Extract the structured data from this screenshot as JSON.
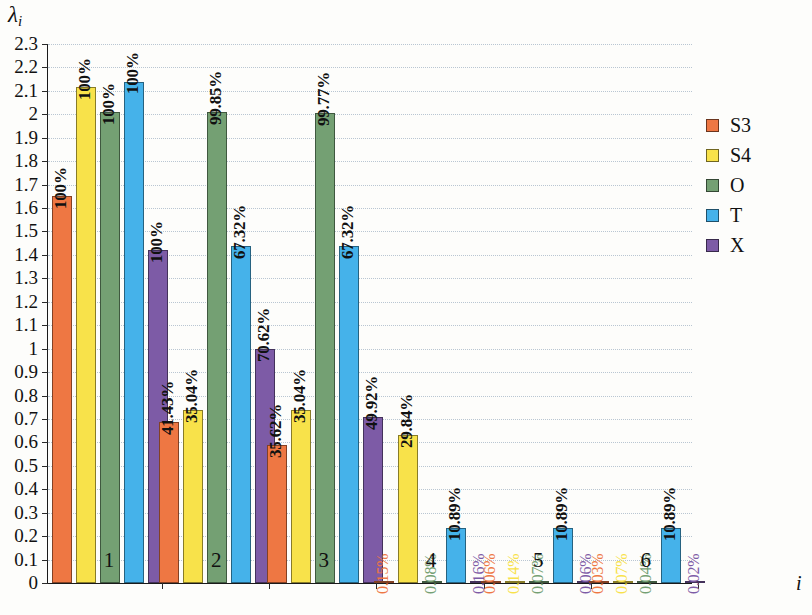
{
  "chart_data": {
    "type": "bar",
    "title": "",
    "xlabel": "i",
    "ylabel": "λ",
    "ylabel_sub": "i",
    "ylim": [
      0,
      2.3
    ],
    "grid": true,
    "legend_position": "right",
    "categories": [
      "1",
      "2",
      "3",
      "4",
      "5",
      "6"
    ],
    "ytick_labels": [
      "0",
      "0.1",
      "0.2",
      "0.3",
      "0.4",
      "0.5",
      "0.6",
      "0.7",
      "0.8",
      "0.9",
      "1",
      "1.1",
      "1.2",
      "1.3",
      "1.4",
      "1.5",
      "1.6",
      "1.7",
      "1.8",
      "1.9",
      "2",
      "2.1",
      "2.2",
      "2.3"
    ],
    "ytick_values": [
      0,
      0.1,
      0.2,
      0.3,
      0.4,
      0.5,
      0.6,
      0.7,
      0.8,
      0.9,
      1.0,
      1.1,
      1.2,
      1.3,
      1.4,
      1.5,
      1.6,
      1.7,
      1.8,
      1.9,
      2.0,
      2.1,
      2.2,
      2.3
    ],
    "series": [
      {
        "name": "S3",
        "color": "#ee7743",
        "values": [
          1.65,
          0.685,
          0.59,
          0.004,
          0.002,
          0.001
        ],
        "labels": [
          "100%",
          "41.43%",
          "35.62%",
          "0.15%",
          "0.06%",
          "0.03%"
        ]
      },
      {
        "name": "S4",
        "color": "#f8e24a",
        "values": [
          2.115,
          0.74,
          0.74,
          0.63,
          0.003,
          0.002
        ],
        "labels": [
          "100%",
          "35.04%",
          "35.04%",
          "29.84%",
          "0.14%",
          "0.07%"
        ]
      },
      {
        "name": "O",
        "color": "#74a073",
        "values": [
          2.01,
          2.01,
          2.005,
          0.002,
          0.002,
          0.001
        ],
        "labels": [
          "100%",
          "99.85%",
          "99.77%",
          "0.08%",
          "0.07%",
          "0.04%"
        ]
      },
      {
        "name": "T",
        "color": "#45b2ea",
        "values": [
          2.14,
          1.44,
          1.44,
          0.233,
          0.233,
          0.233
        ],
        "labels": [
          "100%",
          "67.32%",
          "67.32%",
          "10.89%",
          "10.89%",
          "10.89%"
        ]
      },
      {
        "name": "X",
        "color": "#7d5ba6",
        "values": [
          1.42,
          1.0,
          0.71,
          0.004,
          0.002,
          0.001
        ],
        "labels": [
          "100%",
          "70.62%",
          "49.92%",
          "0.16%",
          "0.06%",
          "0.02%"
        ]
      }
    ]
  },
  "legend": {
    "items": [
      {
        "label": "S3",
        "color": "#ee7743"
      },
      {
        "label": "S4",
        "color": "#f8e24a"
      },
      {
        "label": "O",
        "color": "#74a073"
      },
      {
        "label": "T",
        "color": "#45b2ea"
      },
      {
        "label": "X",
        "color": "#7d5ba6"
      }
    ]
  }
}
